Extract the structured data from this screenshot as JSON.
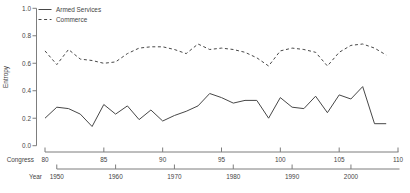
{
  "figure": {
    "ylabel": "Entropy",
    "x_axis_primary_label": "Congress",
    "x_axis_secondary_label": "Year",
    "colors": {
      "background": "#ffffff",
      "series_line": "#474747",
      "axis_line": "#7d7d7d",
      "text": "#454545"
    }
  },
  "chart_data": {
    "type": "line",
    "title": "",
    "ylabel": "Entropy",
    "ylim": [
      0.0,
      1.0
    ],
    "y_ticks": [
      0.0,
      0.2,
      0.4,
      0.6,
      0.8,
      1.0
    ],
    "y_tick_labels": [
      "0.0",
      "0.2",
      "0.4",
      "0.6",
      "0.8",
      "1.0"
    ],
    "grid": false,
    "legend_position": "top-left",
    "x_axis_primary": {
      "label": "Congress",
      "ticks": [
        80,
        85,
        90,
        95,
        100,
        105,
        110
      ],
      "range": [
        80,
        110
      ]
    },
    "x_axis_secondary": {
      "label": "Year",
      "ticks": [
        1950,
        1960,
        1970,
        1980,
        1990,
        2000
      ]
    },
    "x": [
      80,
      81,
      82,
      83,
      84,
      85,
      86,
      87,
      88,
      89,
      90,
      91,
      92,
      93,
      94,
      95,
      96,
      97,
      98,
      99,
      100,
      101,
      102,
      103,
      104,
      105,
      106,
      107,
      108,
      109
    ],
    "series": [
      {
        "name": "Armed Services",
        "style": "solid",
        "values": [
          0.2,
          0.28,
          0.27,
          0.23,
          0.14,
          0.3,
          0.23,
          0.29,
          0.19,
          0.26,
          0.18,
          0.22,
          0.25,
          0.29,
          0.38,
          0.35,
          0.31,
          0.33,
          0.33,
          0.2,
          0.35,
          0.28,
          0.27,
          0.36,
          0.24,
          0.37,
          0.34,
          0.43,
          0.16,
          0.16
        ]
      },
      {
        "name": "Commerce",
        "style": "dashed",
        "values": [
          0.69,
          0.59,
          0.7,
          0.63,
          0.62,
          0.6,
          0.61,
          0.67,
          0.71,
          0.72,
          0.72,
          0.7,
          0.67,
          0.74,
          0.7,
          0.71,
          0.7,
          0.68,
          0.64,
          0.58,
          0.69,
          0.71,
          0.7,
          0.68,
          0.58,
          0.68,
          0.73,
          0.74,
          0.71,
          0.66
        ]
      }
    ]
  }
}
